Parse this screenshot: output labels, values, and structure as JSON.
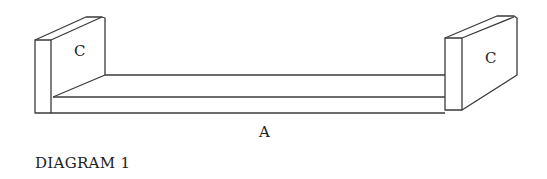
{
  "diagram": {
    "caption": "DIAGRAM 1",
    "parts": {
      "left_panel": {
        "label": "C"
      },
      "right_panel": {
        "label": "C"
      },
      "shelf": {
        "label": "A"
      }
    },
    "colors": {
      "line": "#3a3a3a",
      "background": "#ffffff",
      "text": "#222222"
    }
  }
}
